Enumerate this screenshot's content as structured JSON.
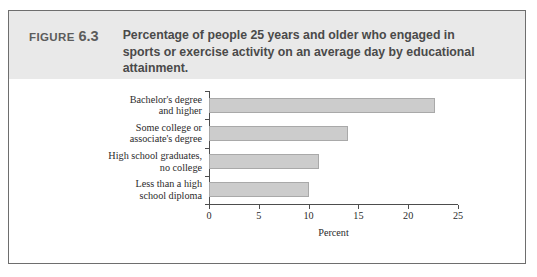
{
  "figure": {
    "label_prefix": "FIGURE",
    "number": "6.3",
    "title_line1": "Percentage of people 25 years and older who engaged in sports or",
    "title_line2": "exercise activity on an average day by educational attainment.",
    "header_bg": "#e9e9e9",
    "border_color": "#6e6e6e"
  },
  "chart_data": {
    "type": "bar",
    "orientation": "horizontal",
    "title": "Percentage of people 25 years and older who engaged in sports or exercise activity on an average day by educational attainment.",
    "categories": [
      "Bachelor's degree and higher",
      "Some college or associate's degree",
      "High school graduates, no college",
      "Less than a high school diploma"
    ],
    "category_lines": [
      [
        "Bachelor's degree",
        "and higher"
      ],
      [
        "Some college or",
        "associate's degree"
      ],
      [
        "High school graduates,",
        "no college"
      ],
      [
        "Less than a high",
        "school diploma"
      ]
    ],
    "values": [
      22.7,
      14.0,
      11.0,
      10.0
    ],
    "xlabel": "Percent",
    "ylabel": "",
    "xlim": [
      0,
      25
    ],
    "xticks": [
      0,
      5,
      10,
      15,
      20,
      25
    ],
    "xtick_labels": [
      "0",
      "5",
      "10",
      "15",
      "20",
      "25"
    ],
    "grid": false,
    "legend": false,
    "bar_fill": "#cccccc",
    "bar_border": "#a9a9a9",
    "axis_color": "#4d4d4d"
  }
}
